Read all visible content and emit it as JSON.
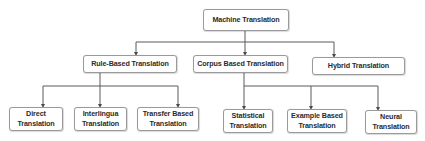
{
  "diagram": {
    "title": "Machine Translation",
    "root": {
      "label": "Machine Translation"
    },
    "level1": [
      {
        "label": "Rule-Based Translation"
      },
      {
        "label": "Corpus Based Translation"
      },
      {
        "label": "Hybrid Translation"
      }
    ],
    "level2_rule_based": [
      {
        "line1": "Direct",
        "line2": "Translation"
      },
      {
        "line1": "Interlingua",
        "line2": "Translation"
      },
      {
        "line1": "Transfer Based",
        "line2": "Translation"
      }
    ],
    "level2_corpus_based": [
      {
        "line1": "Statistical",
        "line2": "Translation"
      },
      {
        "line1": "Example Based",
        "line2": "Translation"
      },
      {
        "line1": "Neural",
        "line2": "Translation"
      }
    ],
    "colors": {
      "line": "#5a5a5a",
      "border": "#9a9a9a",
      "text": "#2b2b2b",
      "background": "#ffffff"
    }
  }
}
